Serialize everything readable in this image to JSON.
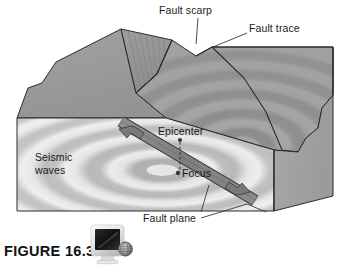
{
  "figure": {
    "caption": "FIGURE 16.3",
    "icon": "computer-monitor-icon",
    "background_color": "#ffffff"
  },
  "diagram": {
    "type": "block-diagram",
    "labels": {
      "fault_scarp": "Fault scarp",
      "fault_trace": "Fault trace",
      "epicenter": "Epicenter",
      "focus": "Focus",
      "fault_plane": "Fault plane",
      "seismic_waves": "Seismic waves"
    },
    "colors": {
      "top_surface": "#9a9a9a",
      "top_surface_dark": "#8c8c8c",
      "front_face": "#d8d8d8",
      "front_face_wave": "#bdbdbd",
      "right_face": "#a5a5a5",
      "outline": "#2b2b2b",
      "leader_line": "#3a3a3a",
      "fault_plane_band": "#7e7e7e",
      "focus_dot": "#3a3a3a"
    },
    "features": {
      "wave_ring_count": 7,
      "focus_marker": "dot",
      "epicenter_marker": "dot",
      "epicenter_to_focus_line": "dashed",
      "fault_motion_arrows": 2
    }
  }
}
